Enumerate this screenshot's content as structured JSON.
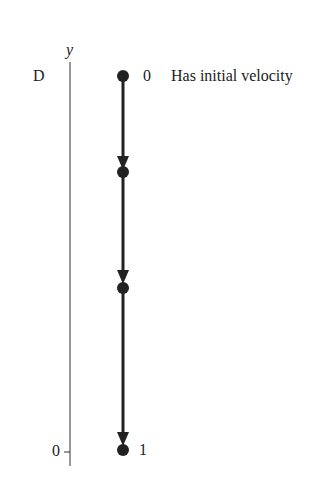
{
  "diagram": {
    "axis": {
      "label": "y",
      "top_label": "D",
      "bottom_tick_label": "0"
    },
    "points": [
      {
        "label": "0",
        "y": 76
      },
      {
        "label": "",
        "y": 172
      },
      {
        "label": "",
        "y": 288
      },
      {
        "label": "1",
        "y": 450
      }
    ],
    "annotation": "Has initial velocity",
    "colors": {
      "ink": "#222222",
      "background": "#ffffff"
    }
  }
}
